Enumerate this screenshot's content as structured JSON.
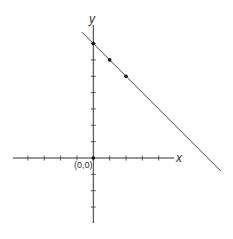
{
  "chart_data": {
    "type": "line",
    "title": "",
    "xlabel": "x",
    "ylabel": "y",
    "origin_label": "(0,0)",
    "x_ticks": [
      -4,
      -3,
      -2,
      -1,
      1,
      2,
      3,
      4
    ],
    "y_ticks": [
      -3,
      -2,
      -1,
      1,
      2,
      3,
      4,
      5,
      6,
      7
    ],
    "xlim": [
      -5.2,
      5.2
    ],
    "ylim": [
      -4,
      8.7
    ],
    "grid": false,
    "line": {
      "slope": -1,
      "intercept": 7,
      "x_range": [
        -0.7,
        7.8
      ]
    },
    "points": [
      {
        "x": 0,
        "y": 7
      },
      {
        "x": 1,
        "y": 6
      },
      {
        "x": 2,
        "y": 5
      },
      {
        "x": 0,
        "y": 0
      }
    ]
  },
  "colors": {
    "axis": "#333333",
    "line": "#444444",
    "point": "#111111"
  }
}
